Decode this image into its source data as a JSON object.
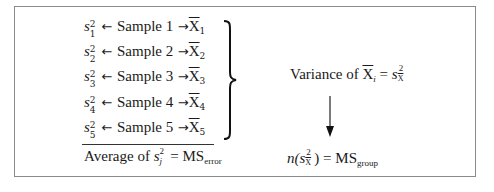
{
  "diagram": {
    "samples": [
      {
        "variance_sub": "1",
        "label": "Sample 1",
        "mean_sub": "1"
      },
      {
        "variance_sub": "2",
        "label": "Sample 2",
        "mean_sub": "2"
      },
      {
        "variance_sub": "3",
        "label": "Sample 3",
        "mean_sub": "3"
      },
      {
        "variance_sub": "4",
        "label": "Sample 4",
        "mean_sub": "4"
      },
      {
        "variance_sub": "5",
        "label": "Sample 5",
        "mean_sub": "5"
      }
    ],
    "variance_symbol": "s",
    "square": "2",
    "mean_symbol": "X",
    "left_arrow": "←",
    "right_arrow": "→",
    "average": {
      "prefix": "Average of ",
      "sub": "j",
      "equals": " = MS",
      "ms_sub": "error"
    },
    "variance_of_means": {
      "prefix": "Variance of ",
      "mean_sub": "i",
      "equals": " = ",
      "frac_bottom": "X"
    },
    "group": {
      "prefix": "n(",
      "suffix": ") = MS",
      "ms_sub": "group"
    }
  }
}
